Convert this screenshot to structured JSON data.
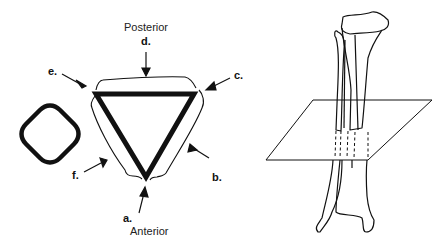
{
  "figure": {
    "orientation_labels": {
      "top": "Posterior",
      "bottom": "Anterior"
    },
    "arrow_labels": [
      {
        "id": "a",
        "text": "a."
      },
      {
        "id": "b",
        "text": "b."
      },
      {
        "id": "c",
        "text": "c."
      },
      {
        "id": "d",
        "text": "d."
      },
      {
        "id": "e",
        "text": "e."
      },
      {
        "id": "f",
        "text": "f."
      }
    ],
    "panels": [
      {
        "name": "round-cross-section",
        "description": "rounded square cross-section"
      },
      {
        "name": "triangular-cross-section",
        "description": "triangular cross-section with surrounding surfaces"
      },
      {
        "name": "tibia-fibula-plane",
        "description": "tibia and fibula with transverse cutting plane"
      }
    ],
    "colors": {
      "ink": "#111111",
      "background": "#ffffff"
    }
  }
}
